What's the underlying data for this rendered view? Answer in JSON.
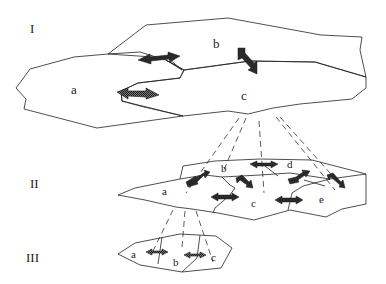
{
  "diagram": {
    "levels": [
      {
        "id": "I",
        "label": "I",
        "regions": [
          "a",
          "b",
          "c"
        ]
      },
      {
        "id": "II",
        "label": "II",
        "regions": [
          "a",
          "b",
          "c",
          "d",
          "e"
        ]
      },
      {
        "id": "III",
        "label": "III",
        "regions": [
          "a",
          "b",
          "c"
        ]
      }
    ],
    "level1": {
      "label": "I",
      "a": "a",
      "b": "b",
      "c": "c"
    },
    "level2": {
      "label": "II",
      "a": "a",
      "b": "b",
      "c": "c",
      "d": "d",
      "e": "e"
    },
    "level3": {
      "label": "III",
      "a": "a",
      "b": "b",
      "c": "c"
    },
    "connections": [
      {
        "from": "I.c",
        "to": "II",
        "style": "dashed"
      },
      {
        "from": "II.a",
        "to": "III",
        "style": "dashed"
      }
    ],
    "exchange_arrows": "double-headed arrows between adjacent regions"
  }
}
